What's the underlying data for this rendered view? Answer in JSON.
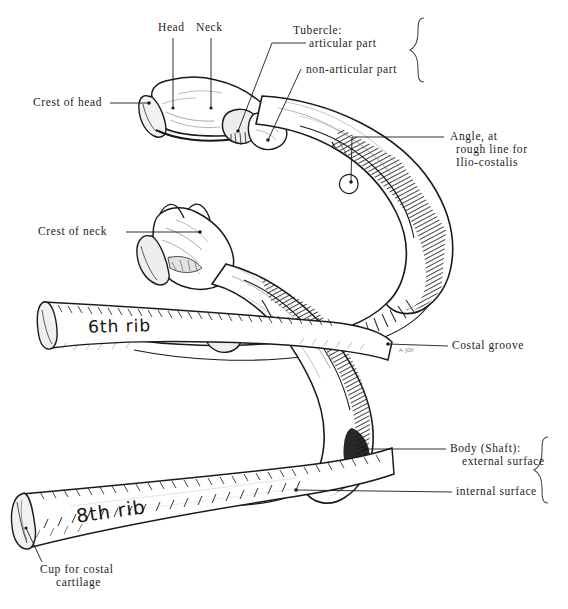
{
  "figure": {
    "background_color": "#ffffff",
    "ink_color": "#1a1a1a",
    "width": 568,
    "height": 609
  },
  "labels": {
    "head": "Head",
    "neck": "Neck",
    "crest_of_head": "Crest of head",
    "tubercle_title": "Tubercle:",
    "tubercle_articular": "articular part",
    "tubercle_non_articular": "non-articular part",
    "angle_line1": "Angle, at",
    "angle_line2": "rough line for",
    "angle_line3": "Ilio-costalis",
    "crest_of_neck": "Crest of neck",
    "costal_groove": "Costal groove",
    "body_shaft_title": "Body (Shaft):",
    "body_external_surface": "external surface",
    "body_internal_surface": "internal surface",
    "cup_line1": "Cup for costal",
    "cup_line2": "cartilage",
    "rib_sixth": "6th rib",
    "rib_eighth": "8th rib"
  }
}
